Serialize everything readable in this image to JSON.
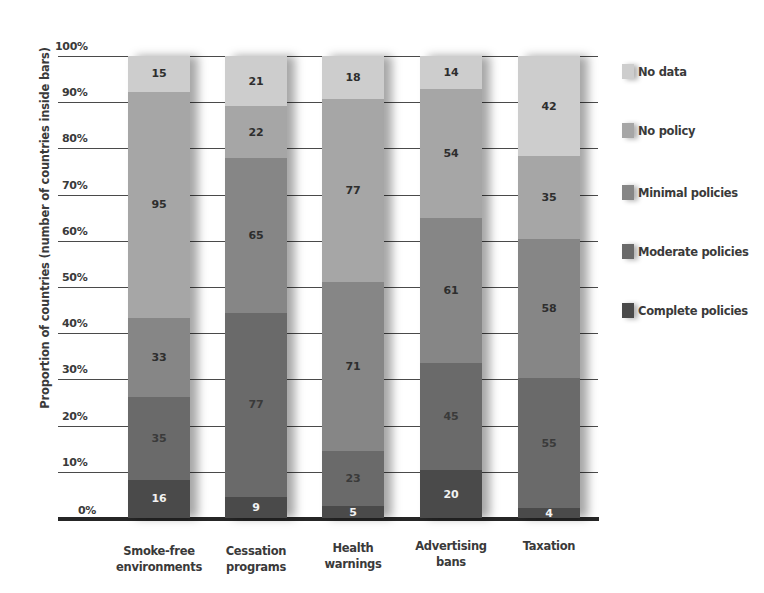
{
  "chart_data": {
    "type": "bar",
    "stacked": true,
    "title": "",
    "xlabel": "",
    "ylabel": "Proportion of countries (number of countries inside bars)",
    "ylim": [
      0,
      100
    ],
    "y_ticks": [
      "0%",
      "10%",
      "20%",
      "30%",
      "40%",
      "50%",
      "60%",
      "70%",
      "80%",
      "90%",
      "100%"
    ],
    "grid": true,
    "legend_position": "right",
    "categories": [
      "Smoke-free environments",
      "Cessation programs",
      "Health warnings",
      "Advertising bans",
      "Taxation"
    ],
    "category_lines": [
      [
        "Smoke-free",
        "environments"
      ],
      [
        "Cessation",
        "programs"
      ],
      [
        "Health",
        "warnings"
      ],
      [
        "Advertising",
        "bans"
      ],
      [
        "Taxation",
        ""
      ]
    ],
    "series": [
      {
        "name": "Complete policies",
        "color": "#4a4a4a",
        "text_color": "#f2f2f2",
        "values": [
          16,
          9,
          5,
          20,
          4
        ]
      },
      {
        "name": "Moderate policies",
        "color": "#6a6a6a",
        "text_color": "#3a3a3a",
        "values": [
          35,
          77,
          23,
          45,
          55
        ]
      },
      {
        "name": "Minimal policies",
        "color": "#868686",
        "text_color": "#2e2e2e",
        "values": [
          33,
          65,
          71,
          61,
          58
        ]
      },
      {
        "name": "No policy",
        "color": "#a6a6a6",
        "text_color": "#2e2e2e",
        "values": [
          95,
          22,
          77,
          54,
          35
        ]
      },
      {
        "name": "No data",
        "color": "#cdcdcd",
        "text_color": "#2e2e2e",
        "values": [
          15,
          21,
          18,
          14,
          42
        ]
      }
    ],
    "totals": [
      194,
      194,
      194,
      194,
      194
    ]
  },
  "legend": [
    {
      "label": "No data",
      "color": "#cdcdcd"
    },
    {
      "label": "No policy",
      "color": "#a6a6a6"
    },
    {
      "label": "Minimal policies",
      "color": "#868686"
    },
    {
      "label": "Moderate policies",
      "color": "#6a6a6a"
    },
    {
      "label": "Complete policies",
      "color": "#4a4a4a"
    }
  ]
}
